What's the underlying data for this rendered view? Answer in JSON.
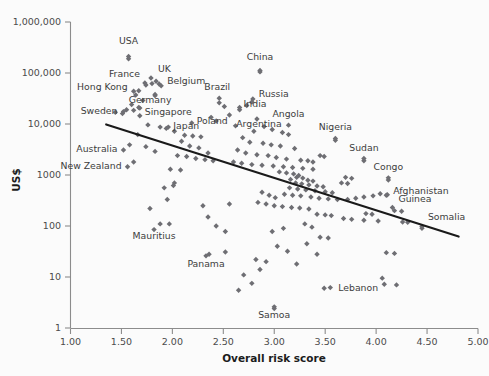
{
  "chart_data": {
    "type": "scatter",
    "title": "",
    "xlabel": "Overall risk score",
    "ylabel": "US$",
    "xlim": [
      1.0,
      5.0
    ],
    "ylim": [
      1,
      1000000
    ],
    "yscale": "log",
    "xscale": "linear",
    "grid": false,
    "legend": null,
    "xticks": [
      "1.00",
      "1.50",
      "2.00",
      "2.50",
      "3.00",
      "3.50",
      "4.00",
      "4.50",
      "5.00"
    ],
    "xtick_values": [
      1.0,
      1.5,
      2.0,
      2.5,
      3.0,
      3.5,
      4.0,
      4.5,
      5.0
    ],
    "yticks": [
      "1,000,000",
      "100,000",
      "10,000",
      "1000",
      "100",
      "10",
      "1"
    ],
    "ytick_values": [
      1000000,
      100000,
      10000,
      1000,
      100,
      10,
      1
    ],
    "marker": "diamond",
    "marker_color": "#6e6e73",
    "trend_line": {
      "label": "",
      "color": "#1a1a1a",
      "x_start": 1.35,
      "y_start": 9800,
      "x_end": 4.81,
      "y_end": 62
    },
    "annotations": [
      {
        "label": "USA",
        "x": 1.57,
        "y": 210000
      },
      {
        "label": "UK",
        "x": 1.84,
        "y": 69000
      },
      {
        "label": "France",
        "x": 1.74,
        "y": 58000
      },
      {
        "label": "Belgium",
        "x": 1.89,
        "y": 56000
      },
      {
        "label": "Hong Kong",
        "x": 1.62,
        "y": 44000
      },
      {
        "label": "Germany",
        "x": 1.83,
        "y": 38000
      },
      {
        "label": "Singapore",
        "x": 1.68,
        "y": 20500
      },
      {
        "label": "Sweden",
        "x": 1.52,
        "y": 17500
      },
      {
        "label": "Japan",
        "x": 1.96,
        "y": 8700
      },
      {
        "label": "Poland",
        "x": 2.19,
        "y": 10500
      },
      {
        "label": "Brazil",
        "x": 2.46,
        "y": 32000
      },
      {
        "label": "China",
        "x": 2.86,
        "y": 112000
      },
      {
        "label": "Russia",
        "x": 2.79,
        "y": 31000
      },
      {
        "label": "India",
        "x": 2.66,
        "y": 21000
      },
      {
        "label": "Argentina",
        "x": 2.83,
        "y": 12500
      },
      {
        "label": "Angola",
        "x": 3.14,
        "y": 9500
      },
      {
        "label": "Nigeria",
        "x": 3.6,
        "y": 5200
      },
      {
        "label": "Sudan",
        "x": 3.88,
        "y": 2100
      },
      {
        "label": "Congo",
        "x": 4.12,
        "y": 880
      },
      {
        "label": "Afghanistan",
        "x": 4.1,
        "y": 400
      },
      {
        "label": "Guinea",
        "x": 4.16,
        "y": 230
      },
      {
        "label": "Somalia",
        "x": 4.45,
        "y": 98
      },
      {
        "label": "Australia",
        "x": 1.52,
        "y": 3100
      },
      {
        "label": "New Zealand",
        "x": 1.56,
        "y": 1450
      },
      {
        "label": "Mauritius",
        "x": 1.82,
        "y": 85
      },
      {
        "label": "Panama",
        "x": 2.33,
        "y": 26
      },
      {
        "label": "Lebanon",
        "x": 3.55,
        "y": 6.2
      },
      {
        "label": "Samoa",
        "x": 3.0,
        "y": 2.6
      }
    ],
    "points": [
      {
        "x": 1.57,
        "y": 190000
      },
      {
        "x": 1.79,
        "y": 80000
      },
      {
        "x": 1.73,
        "y": 64000
      },
      {
        "x": 1.8,
        "y": 62000
      },
      {
        "x": 1.87,
        "y": 61000
      },
      {
        "x": 1.67,
        "y": 45000
      },
      {
        "x": 1.64,
        "y": 37000
      },
      {
        "x": 1.83,
        "y": 36000
      },
      {
        "x": 1.71,
        "y": 29000
      },
      {
        "x": 1.6,
        "y": 24000
      },
      {
        "x": 1.67,
        "y": 21000
      },
      {
        "x": 1.55,
        "y": 19000
      },
      {
        "x": 1.62,
        "y": 18500
      },
      {
        "x": 1.44,
        "y": 17000
      },
      {
        "x": 1.51,
        "y": 16000
      },
      {
        "x": 1.68,
        "y": 14500
      },
      {
        "x": 1.76,
        "y": 9600
      },
      {
        "x": 1.88,
        "y": 8700
      },
      {
        "x": 1.94,
        "y": 8200
      },
      {
        "x": 1.66,
        "y": 6200
      },
      {
        "x": 1.58,
        "y": 3900
      },
      {
        "x": 1.74,
        "y": 3600
      },
      {
        "x": 1.83,
        "y": 2900
      },
      {
        "x": 1.62,
        "y": 1800
      },
      {
        "x": 2.02,
        "y": 7200
      },
      {
        "x": 2.12,
        "y": 6000
      },
      {
        "x": 2.2,
        "y": 5800
      },
      {
        "x": 2.28,
        "y": 5600
      },
      {
        "x": 2.09,
        "y": 4600
      },
      {
        "x": 2.17,
        "y": 3700
      },
      {
        "x": 2.26,
        "y": 3400
      },
      {
        "x": 2.05,
        "y": 2400
      },
      {
        "x": 2.14,
        "y": 2300
      },
      {
        "x": 2.23,
        "y": 2100
      },
      {
        "x": 2.32,
        "y": 2000
      },
      {
        "x": 2.35,
        "y": 2700
      },
      {
        "x": 2.4,
        "y": 1900
      },
      {
        "x": 2.46,
        "y": 26000
      },
      {
        "x": 2.51,
        "y": 22000
      },
      {
        "x": 2.56,
        "y": 15000
      },
      {
        "x": 2.62,
        "y": 9200
      },
      {
        "x": 2.43,
        "y": 11500
      },
      {
        "x": 2.38,
        "y": 13500
      },
      {
        "x": 1.98,
        "y": 1300
      },
      {
        "x": 2.08,
        "y": 1250
      },
      {
        "x": 2.02,
        "y": 700
      },
      {
        "x": 2.01,
        "y": 620
      },
      {
        "x": 1.92,
        "y": 560
      },
      {
        "x": 1.95,
        "y": 330
      },
      {
        "x": 1.78,
        "y": 220
      },
      {
        "x": 1.88,
        "y": 110
      },
      {
        "x": 1.97,
        "y": 110
      },
      {
        "x": 2.3,
        "y": 250
      },
      {
        "x": 2.35,
        "y": 150
      },
      {
        "x": 2.43,
        "y": 100
      },
      {
        "x": 2.52,
        "y": 78
      },
      {
        "x": 2.56,
        "y": 270
      },
      {
        "x": 2.36,
        "y": 28
      },
      {
        "x": 2.52,
        "y": 31
      },
      {
        "x": 2.7,
        "y": 11
      },
      {
        "x": 2.86,
        "y": 105000
      },
      {
        "x": 2.78,
        "y": 27000
      },
      {
        "x": 2.73,
        "y": 23000
      },
      {
        "x": 2.66,
        "y": 19000
      },
      {
        "x": 2.9,
        "y": 8900
      },
      {
        "x": 2.98,
        "y": 7800
      },
      {
        "x": 2.8,
        "y": 7200
      },
      {
        "x": 3.08,
        "y": 6800
      },
      {
        "x": 3.14,
        "y": 6200
      },
      {
        "x": 2.69,
        "y": 5400
      },
      {
        "x": 2.76,
        "y": 4400
      },
      {
        "x": 2.89,
        "y": 4200
      },
      {
        "x": 2.97,
        "y": 3900
      },
      {
        "x": 3.06,
        "y": 3700
      },
      {
        "x": 3.2,
        "y": 3300
      },
      {
        "x": 2.64,
        "y": 3100
      },
      {
        "x": 2.72,
        "y": 2700
      },
      {
        "x": 2.83,
        "y": 2500
      },
      {
        "x": 2.94,
        "y": 2400
      },
      {
        "x": 3.02,
        "y": 2200
      },
      {
        "x": 3.12,
        "y": 2050
      },
      {
        "x": 3.26,
        "y": 1950
      },
      {
        "x": 2.6,
        "y": 1800
      },
      {
        "x": 2.68,
        "y": 1700
      },
      {
        "x": 2.78,
        "y": 1600
      },
      {
        "x": 2.88,
        "y": 1550
      },
      {
        "x": 2.99,
        "y": 1500
      },
      {
        "x": 3.09,
        "y": 1450
      },
      {
        "x": 3.18,
        "y": 1400
      },
      {
        "x": 3.28,
        "y": 1350
      },
      {
        "x": 3.38,
        "y": 1300
      },
      {
        "x": 3.05,
        "y": 1150
      },
      {
        "x": 3.12,
        "y": 1100
      },
      {
        "x": 3.19,
        "y": 1050
      },
      {
        "x": 3.24,
        "y": 980
      },
      {
        "x": 3.22,
        "y": 900
      },
      {
        "x": 3.28,
        "y": 870
      },
      {
        "x": 3.16,
        "y": 820
      },
      {
        "x": 3.33,
        "y": 790
      },
      {
        "x": 3.38,
        "y": 760
      },
      {
        "x": 3.21,
        "y": 700
      },
      {
        "x": 3.27,
        "y": 670
      },
      {
        "x": 3.34,
        "y": 640
      },
      {
        "x": 3.42,
        "y": 610
      },
      {
        "x": 3.48,
        "y": 590
      },
      {
        "x": 3.15,
        "y": 560
      },
      {
        "x": 3.23,
        "y": 530
      },
      {
        "x": 3.31,
        "y": 510
      },
      {
        "x": 3.4,
        "y": 490
      },
      {
        "x": 3.5,
        "y": 470
      },
      {
        "x": 3.57,
        "y": 450
      },
      {
        "x": 3.1,
        "y": 420
      },
      {
        "x": 3.18,
        "y": 400
      },
      {
        "x": 3.26,
        "y": 390
      },
      {
        "x": 3.36,
        "y": 370
      },
      {
        "x": 3.44,
        "y": 350
      },
      {
        "x": 3.53,
        "y": 340
      },
      {
        "x": 3.62,
        "y": 330
      },
      {
        "x": 2.88,
        "y": 460
      },
      {
        "x": 2.95,
        "y": 400
      },
      {
        "x": 3.01,
        "y": 360
      },
      {
        "x": 2.84,
        "y": 290
      },
      {
        "x": 2.92,
        "y": 270
      },
      {
        "x": 3.0,
        "y": 250
      },
      {
        "x": 3.08,
        "y": 240
      },
      {
        "x": 3.17,
        "y": 230
      },
      {
        "x": 3.25,
        "y": 225
      },
      {
        "x": 3.34,
        "y": 215
      },
      {
        "x": 3.6,
        "y": 4800
      },
      {
        "x": 3.45,
        "y": 2400
      },
      {
        "x": 3.49,
        "y": 2300
      },
      {
        "x": 3.33,
        "y": 1900
      },
      {
        "x": 3.38,
        "y": 1800
      },
      {
        "x": 3.88,
        "y": 1900
      },
      {
        "x": 3.7,
        "y": 900
      },
      {
        "x": 3.76,
        "y": 860
      },
      {
        "x": 3.66,
        "y": 700
      },
      {
        "x": 3.72,
        "y": 680
      },
      {
        "x": 4.12,
        "y": 800
      },
      {
        "x": 4.04,
        "y": 430
      },
      {
        "x": 4.11,
        "y": 410
      },
      {
        "x": 3.97,
        "y": 390
      },
      {
        "x": 3.88,
        "y": 370
      },
      {
        "x": 3.8,
        "y": 350
      },
      {
        "x": 3.72,
        "y": 330
      },
      {
        "x": 4.18,
        "y": 200
      },
      {
        "x": 4.25,
        "y": 195
      },
      {
        "x": 3.9,
        "y": 175
      },
      {
        "x": 3.96,
        "y": 170
      },
      {
        "x": 4.45,
        "y": 90
      },
      {
        "x": 3.42,
        "y": 170
      },
      {
        "x": 3.5,
        "y": 165
      },
      {
        "x": 3.56,
        "y": 160
      },
      {
        "x": 3.68,
        "y": 140
      },
      {
        "x": 3.76,
        "y": 135
      },
      {
        "x": 3.88,
        "y": 130
      },
      {
        "x": 4.02,
        "y": 125
      },
      {
        "x": 4.26,
        "y": 120
      },
      {
        "x": 4.31,
        "y": 118
      },
      {
        "x": 3.3,
        "y": 110
      },
      {
        "x": 3.37,
        "y": 95
      },
      {
        "x": 3.09,
        "y": 90
      },
      {
        "x": 2.98,
        "y": 78
      },
      {
        "x": 3.45,
        "y": 60
      },
      {
        "x": 3.53,
        "y": 58
      },
      {
        "x": 3.32,
        "y": 45
      },
      {
        "x": 3.03,
        "y": 40
      },
      {
        "x": 3.13,
        "y": 32
      },
      {
        "x": 3.42,
        "y": 28
      },
      {
        "x": 4.1,
        "y": 30
      },
      {
        "x": 4.18,
        "y": 29
      },
      {
        "x": 2.82,
        "y": 22
      },
      {
        "x": 2.92,
        "y": 20
      },
      {
        "x": 3.22,
        "y": 18
      },
      {
        "x": 4.06,
        "y": 9.5
      },
      {
        "x": 4.08,
        "y": 7.2
      },
      {
        "x": 4.2,
        "y": 7.0
      },
      {
        "x": 2.78,
        "y": 7.5
      },
      {
        "x": 3.49,
        "y": 6.0
      },
      {
        "x": 3.0,
        "y": 2.4
      },
      {
        "x": 2.65,
        "y": 5.5
      },
      {
        "x": 2.86,
        "y": 14
      }
    ]
  }
}
